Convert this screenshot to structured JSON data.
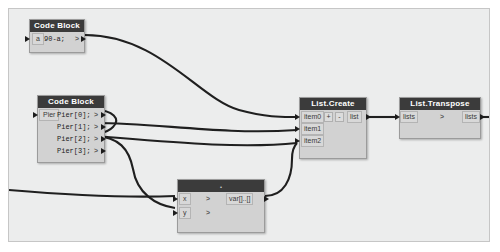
{
  "canvas": {
    "background_color": "#eceded",
    "border_color": "#c6c6c6",
    "wire_color": "#1f1f1f"
  },
  "nodes": [
    {
      "id": "code-block-top",
      "title": "Code Block",
      "inputs": [
        "a"
      ],
      "code_lines": [
        "90-a;"
      ],
      "output_chevron": ">"
    },
    {
      "id": "code-block-pier",
      "title": "Code Block",
      "inputs": [
        "Pier"
      ],
      "code_lines": [
        "Pier[0];",
        "Pier[1];",
        "Pier[2];",
        "Pier[3];"
      ],
      "output_chevron": ">"
    },
    {
      "id": "list-create",
      "title": "List.Create",
      "inputs": [
        "item0",
        "item1",
        "item2"
      ],
      "outputs": [
        "list"
      ],
      "add_button": "+",
      "remove_button": "-"
    },
    {
      "id": "list-transpose",
      "title": "List.Transpose",
      "inputs": [
        "lists"
      ],
      "outputs": [
        "lists"
      ],
      "chevron": ">"
    },
    {
      "id": "math-node",
      "title": ".",
      "inputs": [
        "x",
        "y"
      ],
      "outputs": [
        "var[]..[]"
      ],
      "input_chevron": ">"
    }
  ]
}
